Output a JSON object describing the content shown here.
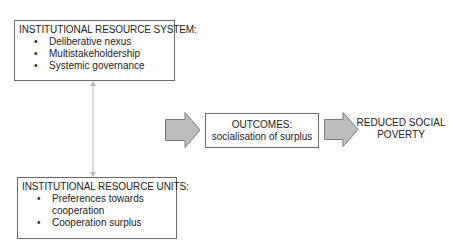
{
  "diagram": {
    "resource_system": {
      "title": "INSTITUTIONAL RESOURCE SYSTEM:",
      "items": [
        "Deliberative nexus",
        "Multistakeholdership",
        "Systemic governance"
      ]
    },
    "resource_units": {
      "title": "INSTITUTIONAL RESOURCE UNITS:",
      "items": [
        "Preferences towards",
        "cooperation",
        "Cooperation surplus"
      ]
    },
    "outcomes": {
      "line1": "OUTCOMES:",
      "line2": "socialisation of surplus"
    },
    "result": {
      "line1": "REDUCED SOCIAL",
      "line2": "POVERTY"
    },
    "bullet": "•",
    "colors": {
      "arrow_fill": "#bdbdbd",
      "arrow_stroke": "#7a7a7a",
      "connector": "#b8b8b8",
      "box_border": "#6b6b6b"
    }
  }
}
